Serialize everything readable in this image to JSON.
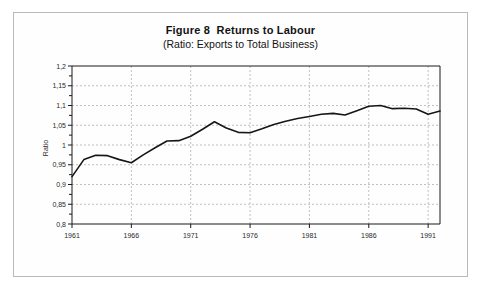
{
  "figure": {
    "title_main": "Figure 8  Returns to Labour",
    "title_sub": "(Ratio: Exports to Total Business)"
  },
  "chart_data": {
    "type": "line",
    "title": "Figure 8  Returns to Labour",
    "subtitle": "(Ratio: Exports to Total Business)",
    "xlabel": "",
    "ylabel": "Ratio",
    "xlim": [
      1961,
      1992
    ],
    "ylim": [
      0.8,
      1.2
    ],
    "ytick_step": 0.05,
    "yticks": [
      0.8,
      0.85,
      0.9,
      0.95,
      1.0,
      1.05,
      1.1,
      1.15,
      1.2
    ],
    "ytick_labels": [
      "0,8",
      "0,85",
      "0,9",
      "0,95",
      "1",
      "1,05",
      "1,1",
      "1,15",
      "1,2"
    ],
    "xticks": [
      1961,
      1966,
      1971,
      1976,
      1981,
      1986,
      1991
    ],
    "xtick_labels": [
      "1961",
      "1966",
      "1971",
      "1976",
      "1981",
      "1986",
      "1991"
    ],
    "grid": true,
    "grid_style": "dashed",
    "legend": false,
    "minor_ticks": true,
    "x": [
      1961,
      1962,
      1963,
      1964,
      1965,
      1966,
      1967,
      1968,
      1969,
      1970,
      1971,
      1972,
      1973,
      1974,
      1975,
      1976,
      1977,
      1978,
      1979,
      1980,
      1981,
      1982,
      1983,
      1984,
      1985,
      1986,
      1987,
      1988,
      1989,
      1990,
      1991,
      1992
    ],
    "series": [
      {
        "name": "Ratio: Exports to Total Business",
        "color": "#161616",
        "values": [
          0.92,
          0.963,
          0.974,
          0.973,
          0.963,
          0.955,
          0.975,
          0.993,
          1.01,
          1.011,
          1.022,
          1.04,
          1.059,
          1.043,
          1.032,
          1.031,
          1.041,
          1.052,
          1.06,
          1.067,
          1.072,
          1.078,
          1.08,
          1.076,
          1.087,
          1.098,
          1.1,
          1.092,
          1.093,
          1.091,
          1.078,
          1.086
        ]
      }
    ]
  },
  "series_extra": {
    "note": "later segment continues with peak and decline",
    "x2": [
      1993,
      1994,
      1995,
      1996,
      1997
    ],
    "values2": [
      1.103,
      1.118,
      1.105,
      1.093,
      1.089
    ]
  }
}
